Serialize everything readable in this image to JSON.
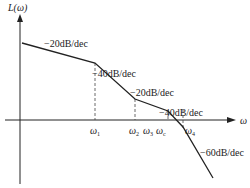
{
  "diagram": {
    "type": "bode-magnitude-asymptotic",
    "y_axis_label": "L(ω)",
    "x_axis_label": "ω",
    "axis_color": "#222222",
    "line_color": "#222222",
    "segments": [
      {
        "slope_label": "−20dB/dec"
      },
      {
        "slope_label": "−40dB/dec"
      },
      {
        "slope_label": "−20dB/dec"
      },
      {
        "slope_label": "−40dB/dec"
      },
      {
        "slope_label": "−60dB/dec"
      }
    ],
    "frequency_marks": [
      {
        "symbol": "ω",
        "sub": "1"
      },
      {
        "symbol": "ω",
        "sub": "2"
      },
      {
        "symbol": "ω",
        "sub": "3"
      },
      {
        "symbol": "ω",
        "sub": "c"
      },
      {
        "symbol": "ω",
        "sub": "4"
      }
    ]
  }
}
